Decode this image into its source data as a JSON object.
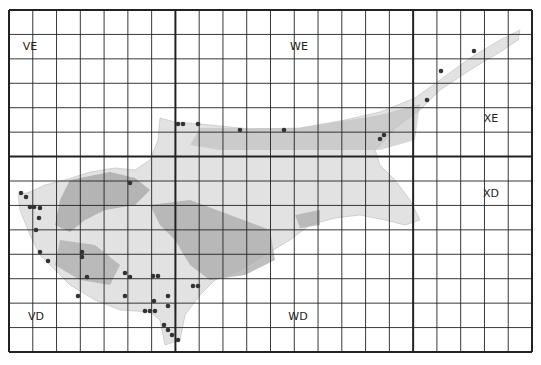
{
  "map": {
    "title": "",
    "frame": {
      "x0": 9,
      "y0": 10,
      "x1": 532,
      "y1": 352
    },
    "grid": {
      "cols": 22,
      "rows": 14,
      "major_cols": [
        7,
        17
      ],
      "major_rows": [
        6
      ]
    },
    "squares": [
      {
        "id": "VE",
        "x": 30,
        "y": 50
      },
      {
        "id": "WE",
        "x": 299,
        "y": 50
      },
      {
        "id": "XE",
        "x": 491,
        "y": 122
      },
      {
        "id": "XD",
        "x": 491,
        "y": 197
      },
      {
        "id": "VD",
        "x": 36,
        "y": 320
      },
      {
        "id": "WD",
        "x": 298,
        "y": 320
      }
    ],
    "colors": {
      "grid": "#222222",
      "island": "#dcdcdc",
      "relief": "#a8a8a8",
      "dot": "#333333"
    },
    "records": [
      [
        178,
        124
      ],
      [
        183,
        124
      ],
      [
        198,
        124
      ],
      [
        240,
        130
      ],
      [
        284,
        130
      ],
      [
        474,
        51
      ],
      [
        441,
        71
      ],
      [
        427,
        100
      ],
      [
        384,
        135
      ],
      [
        380,
        139
      ],
      [
        130,
        183
      ],
      [
        21,
        193
      ],
      [
        26,
        197
      ],
      [
        30,
        207
      ],
      [
        34,
        207
      ],
      [
        40,
        208
      ],
      [
        39,
        218
      ],
      [
        36,
        230
      ],
      [
        40,
        252
      ],
      [
        48,
        261
      ],
      [
        82,
        252
      ],
      [
        82,
        257
      ],
      [
        87,
        277
      ],
      [
        78,
        296
      ],
      [
        125,
        273
      ],
      [
        130,
        277
      ],
      [
        125,
        296
      ],
      [
        153,
        276
      ],
      [
        158,
        276
      ],
      [
        168,
        296
      ],
      [
        154,
        301
      ],
      [
        168,
        306
      ],
      [
        145,
        311
      ],
      [
        150,
        311
      ],
      [
        155,
        311
      ],
      [
        164,
        325
      ],
      [
        168,
        330
      ],
      [
        172,
        335
      ],
      [
        178,
        340
      ],
      [
        193,
        286
      ],
      [
        198,
        286
      ]
    ]
  }
}
